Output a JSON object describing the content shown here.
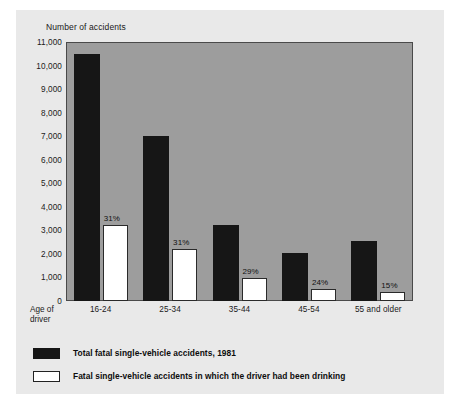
{
  "chart_data": {
    "type": "bar",
    "title": "",
    "ylabel": "Number of accidents",
    "xlabel": "Age of driver",
    "xlabel_line1": "Age of",
    "xlabel_line2": "driver",
    "categories": [
      "16-24",
      "25-34",
      "35-44",
      "45-54",
      "55 and older"
    ],
    "ylim": [
      0,
      11000
    ],
    "yticks": [
      0,
      1000,
      2000,
      3000,
      4000,
      5000,
      6000,
      7000,
      8000,
      9000,
      10000,
      11000
    ],
    "ytick_labels": [
      "0",
      "1,000",
      "2,000",
      "3,000",
      "4,000",
      "5,000",
      "6,000",
      "7,000",
      "8,000",
      "9,000",
      "10,000",
      "11,000"
    ],
    "grid": false,
    "legend_position": "below-plot",
    "series": [
      {
        "name": "Total fatal single-vehicle accidents, 1981",
        "color": "#161616",
        "values": [
          10490,
          7000,
          3230,
          2040,
          2550
        ]
      },
      {
        "name": "Fatal single-vehicle accidents in which the driver had been drinking",
        "color": "#ffffff",
        "values": [
          3230,
          2210,
          980,
          490,
          390
        ]
      }
    ],
    "annotations": [
      "31%",
      "31%",
      "29%",
      "24%",
      "15%"
    ]
  },
  "legend": {
    "items": [
      {
        "swatch": "dark",
        "label": "Total fatal single-vehicle accidents, 1981"
      },
      {
        "swatch": "light",
        "label": "Fatal single-vehicle accidents in which the driver had been drinking"
      }
    ]
  },
  "colors": {
    "page_background": "#e9e9e9",
    "plot_background": "#9d9d9d",
    "frame": "#4a4a4a",
    "bar_dark": "#161616",
    "bar_light": "#ffffff",
    "text": "#1a1a1a"
  }
}
